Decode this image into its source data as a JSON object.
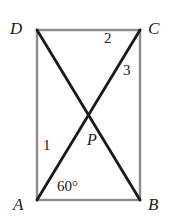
{
  "figure": {
    "type": "geometry-diagram",
    "canvas": {
      "width": 177,
      "height": 223,
      "background": "#ffffff"
    },
    "colors": {
      "rectangle_stroke": "#8c8c8c",
      "diagonal_stroke": "#1a1a1a",
      "label_color": "#1a1a1a"
    },
    "rectangle": {
      "name": "rectangle-ABCD",
      "x": 37,
      "y": 30,
      "width": 103,
      "height": 170,
      "stroke_width": 2.4
    },
    "vertices": [
      {
        "id": "D",
        "label": "D",
        "x": 37,
        "y": 30
      },
      {
        "id": "C",
        "label": "C",
        "x": 140,
        "y": 30
      },
      {
        "id": "B",
        "label": "B",
        "x": 140,
        "y": 200
      },
      {
        "id": "A",
        "label": "A",
        "x": 37,
        "y": 200
      }
    ],
    "intersection": {
      "id": "P",
      "label": "P",
      "x": 88,
      "y": 114
    },
    "diagonals": [
      {
        "name": "diagonal-D-B",
        "from": "D",
        "to": "B",
        "x1": 37,
        "y1": 30,
        "x2": 140,
        "y2": 200,
        "stroke_width": 2.8
      },
      {
        "name": "diagonal-A-C",
        "from": "A",
        "to": "C",
        "x1": 37,
        "y1": 200,
        "x2": 140,
        "y2": 30,
        "stroke_width": 2.8
      }
    ],
    "angle_labels": [
      {
        "id": "angle-1",
        "text": "1",
        "x": 43,
        "y": 138,
        "note": "angle at A between AD and AC"
      },
      {
        "id": "angle-2",
        "text": "2",
        "x": 104,
        "y": 31,
        "note": "angle at C between CD and CA"
      },
      {
        "id": "angle-3",
        "text": "3",
        "x": 123,
        "y": 63,
        "note": "angle at C between CA and CB"
      },
      {
        "id": "angle-60",
        "text": "60°",
        "x": 57,
        "y": 179,
        "note": "angle at A between AC and AB"
      }
    ]
  }
}
